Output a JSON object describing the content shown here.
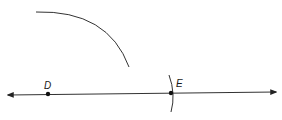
{
  "diagram": {
    "type": "geometric-construction",
    "line": {
      "x1": 8,
      "y1": 95,
      "x2": 276,
      "y2": 92,
      "arrows": "both"
    },
    "points": [
      {
        "label": "D",
        "x": 48,
        "y": 94,
        "label_x": 44,
        "label_y": 89
      },
      {
        "label": "E",
        "x": 171,
        "y": 93,
        "label_x": 176,
        "label_y": 87
      }
    ],
    "arcs": [
      {
        "name": "large-arc",
        "path": "M 36 12 Q 108 10 129 67"
      },
      {
        "name": "small-arc-at-E",
        "path": "M 169 75 Q 176 94 171 112"
      }
    ],
    "colors": {
      "stroke": "#333333",
      "point": "#111111"
    }
  }
}
